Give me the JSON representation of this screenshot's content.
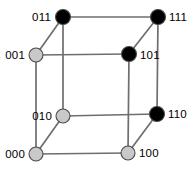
{
  "figure": {
    "width": 195,
    "height": 171,
    "background_color": "#ffffff",
    "edge_color": "#6e6e6e",
    "vertex_outline_color": "#4a4a4a",
    "label_color": "#000000",
    "fill_colors": {
      "filled": "#000000",
      "unfilled": "#c9c9c9"
    }
  },
  "vertices": [
    {
      "id": "v011",
      "label": "011",
      "x": 63,
      "y": 17,
      "r": 7.5,
      "fill": "#000000",
      "state": "filled",
      "label_side": "left",
      "label_x": 51,
      "label_y": 21
    },
    {
      "id": "v111",
      "label": "111",
      "x": 158,
      "y": 17,
      "r": 7.5,
      "fill": "#000000",
      "state": "filled",
      "label_side": "right",
      "label_x": 169,
      "label_y": 21
    },
    {
      "id": "v001",
      "label": "001",
      "x": 36,
      "y": 55,
      "r": 7.0,
      "fill": "#c9c9c9",
      "state": "unfilled",
      "label_side": "left",
      "label_x": 25,
      "label_y": 59
    },
    {
      "id": "v101",
      "label": "101",
      "x": 129,
      "y": 54,
      "r": 7.5,
      "fill": "#000000",
      "state": "filled",
      "label_side": "right",
      "label_x": 140,
      "label_y": 59
    },
    {
      "id": "v010",
      "label": "010",
      "x": 63,
      "y": 116,
      "r": 7.0,
      "fill": "#c9c9c9",
      "state": "unfilled",
      "label_side": "left",
      "label_x": 52,
      "label_y": 120
    },
    {
      "id": "v110",
      "label": "110",
      "x": 157,
      "y": 114,
      "r": 7.5,
      "fill": "#000000",
      "state": "filled",
      "label_side": "right",
      "label_x": 168,
      "label_y": 118
    },
    {
      "id": "v000",
      "label": "000",
      "x": 36,
      "y": 154,
      "r": 7.0,
      "fill": "#c9c9c9",
      "state": "unfilled",
      "label_side": "left",
      "label_x": 25,
      "label_y": 158
    },
    {
      "id": "v100",
      "label": "100",
      "x": 128,
      "y": 153,
      "r": 7.0,
      "fill": "#c9c9c9",
      "state": "unfilled",
      "label_side": "right",
      "label_x": 139,
      "label_y": 157
    }
  ],
  "edges": [
    {
      "id": "e-011-111",
      "from": "011",
      "to": "111",
      "x1": 63,
      "y1": 17,
      "x2": 158,
      "y2": 17
    },
    {
      "id": "e-001-101",
      "from": "001",
      "to": "101",
      "x1": 36,
      "y1": 55,
      "x2": 129,
      "y2": 54
    },
    {
      "id": "e-010-110",
      "from": "010",
      "to": "110",
      "x1": 63,
      "y1": 116,
      "x2": 157,
      "y2": 114
    },
    {
      "id": "e-000-100",
      "from": "000",
      "to": "100",
      "x1": 36,
      "y1": 154,
      "x2": 128,
      "y2": 153
    },
    {
      "id": "e-011-010",
      "from": "011",
      "to": "010",
      "x1": 63,
      "y1": 17,
      "x2": 63,
      "y2": 116
    },
    {
      "id": "e-111-110",
      "from": "111",
      "to": "110",
      "x1": 158,
      "y1": 17,
      "x2": 157,
      "y2": 114
    },
    {
      "id": "e-001-000",
      "from": "001",
      "to": "000",
      "x1": 36,
      "y1": 55,
      "x2": 36,
      "y2": 154
    },
    {
      "id": "e-101-100",
      "from": "101",
      "to": "100",
      "x1": 129,
      "y1": 54,
      "x2": 128,
      "y2": 153
    },
    {
      "id": "e-001-011",
      "from": "001",
      "to": "011",
      "x1": 36,
      "y1": 55,
      "x2": 63,
      "y2": 17
    },
    {
      "id": "e-101-111",
      "from": "101",
      "to": "111",
      "x1": 129,
      "y1": 54,
      "x2": 158,
      "y2": 17
    },
    {
      "id": "e-000-010",
      "from": "000",
      "to": "010",
      "x1": 36,
      "y1": 154,
      "x2": 63,
      "y2": 116
    },
    {
      "id": "e-100-110",
      "from": "100",
      "to": "110",
      "x1": 128,
      "y1": 153,
      "x2": 157,
      "y2": 114
    }
  ]
}
